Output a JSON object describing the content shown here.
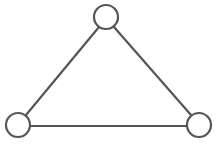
{
  "diagram": {
    "type": "graph",
    "stroke_color": "#555555",
    "fill_color": "#ffffff",
    "node_radius": 12,
    "nodes": [
      {
        "id": "top",
        "x": 106,
        "y": 17
      },
      {
        "id": "bottom-left",
        "x": 18,
        "y": 125
      },
      {
        "id": "bottom-right",
        "x": 199,
        "y": 125
      }
    ],
    "edges": [
      {
        "from": "top",
        "to": "bottom-left"
      },
      {
        "from": "top",
        "to": "bottom-right"
      },
      {
        "from": "bottom-left",
        "to": "bottom-right"
      }
    ]
  }
}
